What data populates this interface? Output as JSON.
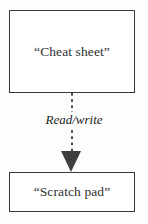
{
  "diagram": {
    "type": "flow-diagram",
    "title": "",
    "background_color": "#fdfdfc",
    "stroke_color": "#3a3a3c",
    "text_color": "#2e2e30",
    "nodes": [
      {
        "id": "cheat-sheet",
        "label": "“Cheat sheet”",
        "shape": "rectangle",
        "x": 9,
        "y": 10,
        "width": 126,
        "height": 83
      },
      {
        "id": "scratch-pad",
        "label": "“Scratch pad”",
        "shape": "rectangle",
        "x": 9,
        "y": 172,
        "width": 126,
        "height": 40
      }
    ],
    "edges": [
      {
        "id": "cheat-sheet-to-scratch-pad",
        "label": "Read/write",
        "from": "cheat-sheet",
        "to": "scratch-pad",
        "style": "dashed",
        "arrowhead": "solid-triangle",
        "arrow_color": "#3f3f41",
        "label_style": "italic",
        "direction": "down"
      }
    ]
  }
}
